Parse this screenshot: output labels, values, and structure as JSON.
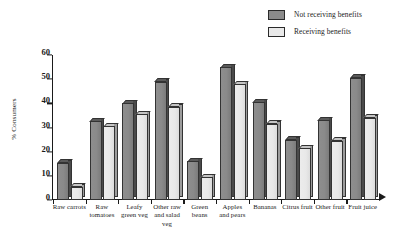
{
  "chart_data": {
    "type": "bar",
    "title": "",
    "xlabel": "",
    "ylabel": "% Consumers",
    "ylim": [
      0,
      60
    ],
    "yticks": [
      0,
      10,
      20,
      30,
      40,
      50,
      60
    ],
    "grid": false,
    "legend_position": "top-right",
    "categories": [
      "Raw carrots",
      "Raw tomatoes",
      "Leafy green veg",
      "Other raw and salad veg",
      "Green beans",
      "Apples and pears",
      "Bananas",
      "Citrus fruit",
      "Other fruit",
      "Fruit juice"
    ],
    "category_lines": [
      [
        "Raw carrots"
      ],
      [
        "Raw",
        "tomatoes"
      ],
      [
        "Leafy",
        "green veg"
      ],
      [
        "Other raw",
        "and salad",
        "veg"
      ],
      [
        "Green",
        "beans"
      ],
      [
        "Apples",
        "and pears"
      ],
      [
        "Bananas"
      ],
      [
        "Citrus fruit"
      ],
      [
        "Other fruit"
      ],
      [
        "Fruit juice"
      ]
    ],
    "series": [
      {
        "name": "Not receiving benefits",
        "color": "#8a8a8a",
        "values": [
          15.5,
          32.5,
          40.0,
          49.0,
          16.0,
          55.0,
          40.5,
          25.0,
          33.0,
          50.5
        ]
      },
      {
        "name": "Receiving benefits",
        "color": "#e8e8e8",
        "values": [
          5.5,
          30.5,
          35.5,
          38.5,
          9.5,
          48.0,
          31.5,
          21.5,
          24.5,
          34.0
        ]
      }
    ]
  },
  "legend": {
    "items": [
      {
        "label": "Not receiving benefits",
        "swatch": "dark"
      },
      {
        "label": "Receiving benefits",
        "swatch": "light"
      }
    ]
  },
  "axes": {
    "y_label": "% Consumers",
    "y_tick_labels": [
      "60",
      "50",
      "40",
      "30",
      "20",
      "10",
      "0"
    ]
  }
}
